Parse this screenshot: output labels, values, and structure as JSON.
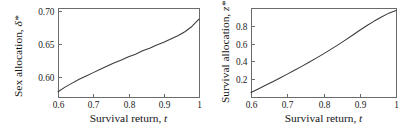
{
  "figure": {
    "background": "#ffffff",
    "curve_color": "#3a3a3a",
    "axis_color": "#6b6b6b",
    "text_color": "#1a1a1a"
  },
  "panels": [
    {
      "id": "left",
      "xlabel_main": "Survival return,",
      "xlabel_sym": "t",
      "ylabel_main": "Sex allocation,",
      "ylabel_sym": "δ*",
      "xticklabels": [
        "0.6",
        "0.7",
        "0.8",
        "0.9",
        "1"
      ],
      "yticklabels": [
        "0.60",
        "0.65",
        "0.70"
      ]
    },
    {
      "id": "right",
      "xlabel_main": "Survival return,",
      "xlabel_sym": "t",
      "ylabel_main": "Survival allocation,",
      "ylabel_sym": "z*",
      "xticklabels": [
        "0.6",
        "0.7",
        "0.8",
        "0.9",
        "1"
      ],
      "yticklabels": [
        "0.2",
        "0.4",
        "0.6",
        "0.8"
      ]
    }
  ],
  "chart_data": [
    {
      "type": "line",
      "panel": "left",
      "title": "",
      "xlabel": "Survival return, t",
      "ylabel": "Sex allocation, δ*",
      "xlim": [
        0.6,
        1.0
      ],
      "ylim": [
        0.57,
        0.705
      ],
      "xticks": [
        0.6,
        0.7,
        0.8,
        0.9,
        1.0
      ],
      "xticklabels": [
        "0.6",
        "0.7",
        "0.8",
        "0.9",
        "1"
      ],
      "yticks": [
        0.6,
        0.65,
        0.7
      ],
      "yticklabels": [
        "0.60",
        "0.65",
        "0.70"
      ],
      "grid": false,
      "legend": null,
      "series": [
        {
          "name": "delta_star",
          "x": [
            0.6,
            0.62,
            0.64,
            0.66,
            0.68,
            0.7,
            0.72,
            0.74,
            0.76,
            0.78,
            0.8,
            0.82,
            0.84,
            0.86,
            0.88,
            0.9,
            0.92,
            0.94,
            0.96,
            0.98,
            1.0
          ],
          "y": [
            0.578,
            0.585,
            0.591,
            0.597,
            0.602,
            0.607,
            0.612,
            0.617,
            0.622,
            0.626,
            0.631,
            0.635,
            0.64,
            0.644,
            0.649,
            0.653,
            0.658,
            0.663,
            0.669,
            0.677,
            0.688
          ]
        }
      ]
    },
    {
      "type": "line",
      "panel": "right",
      "title": "",
      "xlabel": "Survival return, t",
      "ylabel": "Survival allocation, z*",
      "xlim": [
        0.6,
        1.0
      ],
      "ylim": [
        0.0,
        1.0
      ],
      "xticks": [
        0.6,
        0.7,
        0.8,
        0.9,
        1.0
      ],
      "xticklabels": [
        "0.6",
        "0.7",
        "0.8",
        "0.9",
        "1"
      ],
      "yticks": [
        0.2,
        0.4,
        0.6,
        0.8
      ],
      "yticklabels": [
        "0.2",
        "0.4",
        "0.6",
        "0.8"
      ],
      "grid": false,
      "legend": null,
      "series": [
        {
          "name": "z_star",
          "x": [
            0.6,
            0.62,
            0.64,
            0.66,
            0.68,
            0.7,
            0.72,
            0.74,
            0.76,
            0.78,
            0.8,
            0.82,
            0.84,
            0.86,
            0.88,
            0.9,
            0.92,
            0.94,
            0.96,
            0.98,
            1.0
          ],
          "y": [
            0.05,
            0.09,
            0.131,
            0.172,
            0.214,
            0.257,
            0.3,
            0.344,
            0.39,
            0.437,
            0.485,
            0.535,
            0.586,
            0.639,
            0.694,
            0.75,
            0.803,
            0.853,
            0.899,
            0.942,
            0.972
          ]
        }
      ]
    }
  ]
}
